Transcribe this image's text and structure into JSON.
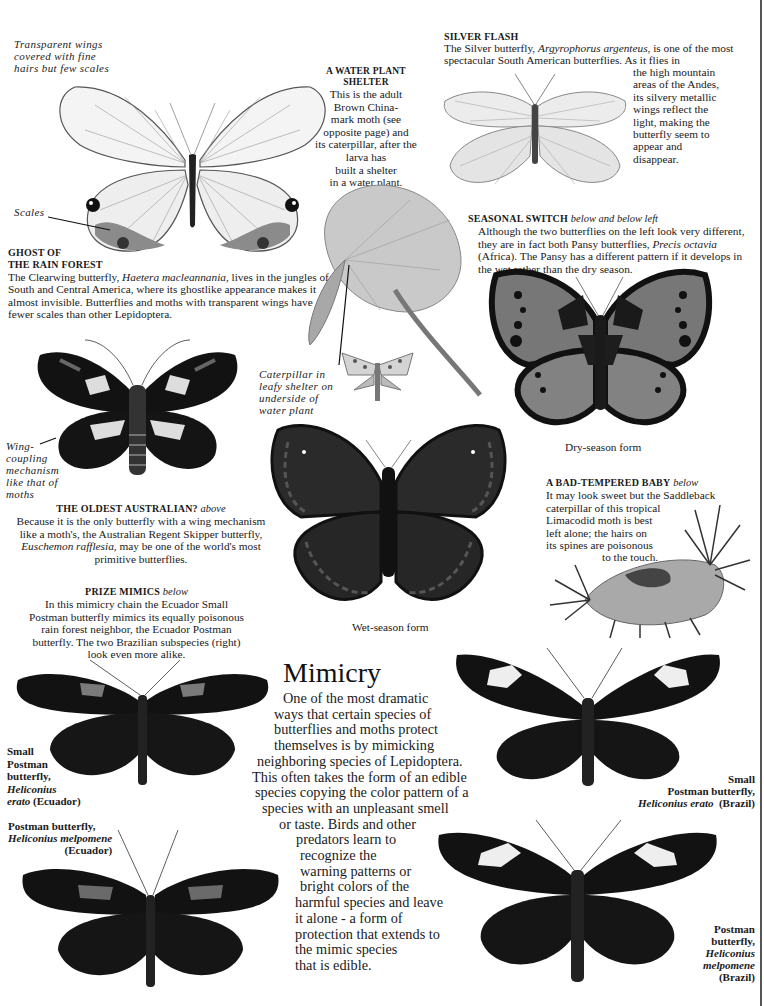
{
  "page": {
    "title": "Mimicry",
    "intro": "One of the most dramatic ways that certain species of butterflies and moths protect themselves is by mimicking neighboring species of Lepidoptera. This often takes the form of an edible species copying the color pattern of a species with an unpleasant smell or taste. Birds and other predators learn to recognize the warning patterns or bright colors of the harmful species and leave it alone - a form of protection that extends to the mimic species that is edible.",
    "intro_lines": [
      "One of the most dramatic",
      "ways that certain species of",
      "butterflies and moths protect",
      "themselves is by mimicking",
      "neighboring species of Lepidoptera.",
      "This often takes the form of an edible",
      "species copying the color pattern of a",
      "species with an unpleasant smell",
      "or taste. Birds and other",
      "predators learn to",
      "recognize the",
      "warning patterns or",
      "bright colors of the",
      "harmful species and leave",
      "it alone - a form of",
      "protection that extends to",
      "the mimic species",
      "that is edible."
    ]
  },
  "sections": {
    "ghost": {
      "annotation_wings": [
        "Transparent wings",
        "covered with fine",
        "hairs but few scales"
      ],
      "annotation_scales": "Scales",
      "heading": [
        "GHOST OF",
        "THE RAIN FOREST"
      ],
      "body_pre": "The Clearwing butterfly, ",
      "species": "Haetera macleannania,",
      "body_post": " lives in the jungles of South and Central America, where its ghostlike appearance makes it almost invisible. Butterflies and moths with transparent wings have fewer scales than other Lepidoptera."
    },
    "water_plant": {
      "heading": [
        "A WATER PLANT",
        "SHELTER"
      ],
      "body_lines": [
        "This is the adult",
        "Brown China-",
        "mark moth (see",
        "opposite page) and",
        "its caterpillar, after the",
        "larva  has",
        "built a shelter",
        "in a water plant."
      ],
      "caption": [
        "Caterpillar  in",
        "leafy  shelter on",
        "underside of",
        "water plant"
      ]
    },
    "silver_flash": {
      "heading": "SILVER FLASH",
      "body_pre": "The Silver butterfly,  ",
      "species": "Argyrophorus argenteus,",
      "body_post": " is one of the most spectacular South American butterflies. As it flies in",
      "body_cont": [
        "the high mountain",
        "areas of the Andes,",
        "its silvery metallic",
        "wings reflect the",
        "light, making the",
        "butterfly seem to",
        "appear and",
        "disappear."
      ]
    },
    "seasonal_switch": {
      "heading": "SEASONAL SWITCH",
      "heading_note": "below and below left",
      "body_pre": "Although the two butterflies on the left look very different, they are in fact both Pansy butterflies, ",
      "species": "Precis octavia",
      "body_post": "  (Africa). The Pansy has a different pattern if it develops in the wet rather than the dry season.",
      "dry_caption": "Dry-season form",
      "wet_caption": "Wet-season form"
    },
    "oldest_australian": {
      "annotation": [
        "Wing-",
        "coupling",
        "mechanism",
        "like  that  of",
        "moths"
      ],
      "heading": "THE OLDEST AUSTRALIAN?",
      "heading_note": "above",
      "body_pre": "Because it is the only butterfly with a wing mechanism like a moth's, the Australian Regent Skipper butterfly, ",
      "species": "Euschemon rafflesia,",
      "body_post": "  may be one of the world's most primitive butterflies."
    },
    "bad_tempered": {
      "heading": "A BAD-TEMPERED BABY",
      "heading_note": "below",
      "body_lines": [
        "It may look sweet but the Saddleback",
        "caterpillar of this tropical",
        "Limacodid moth is best",
        "left alone; the hairs on",
        "its spines are poisonous",
        "to the touch."
      ]
    },
    "prize_mimics": {
      "heading": "PRIZE MIMICS",
      "heading_note": "below",
      "body_lines": [
        "In this mimicry chain the Ecuador Small",
        "Postman butterfly mimics its equally poisonous",
        "rain forest neighbor, the Ecuador Postman",
        "butterfly. The two Brazilian subspecies (right)",
        "look even more alike."
      ]
    },
    "labels": {
      "small_postman_ecuador": {
        "name": [
          "Small",
          "Postman",
          "butterfly,"
        ],
        "species": [
          "Heliconius",
          "erato"
        ],
        "region": "(Ecuador)"
      },
      "postman_ecuador": {
        "name": "Postman butterfly,",
        "species": "Heliconius melpomene",
        "region": "(Ecuador)"
      },
      "small_postman_brazil": {
        "name": [
          "Small",
          "Postman butterfly,"
        ],
        "species": "Heliconius erato",
        "region": "(Brazil)"
      },
      "postman_brazil": {
        "name": [
          "Postman",
          "butterfly,"
        ],
        "species": [
          "Heliconius",
          "melpomene"
        ],
        "region": "(Brazil)"
      }
    }
  },
  "colors": {
    "ink": "#1a1a1a",
    "wing_black": "#141414",
    "wing_gray": "#6d6d6d",
    "page": "#ffffff",
    "red_patch": "#8a8a8a"
  }
}
